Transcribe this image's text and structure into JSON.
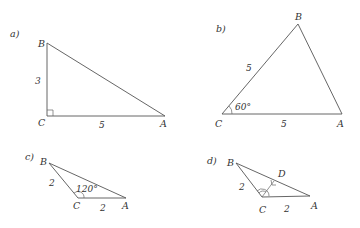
{
  "figures": [
    {
      "id": "a",
      "label": "a)",
      "vertices": {
        "A": "A",
        "B": "B",
        "C": "C"
      },
      "sides": {
        "BC": "3",
        "CA": "5"
      },
      "angle": {
        "at": "C",
        "value": "90°",
        "marker": "right-angle"
      }
    },
    {
      "id": "b",
      "label": "b)",
      "vertices": {
        "A": "A",
        "B": "B",
        "C": "C"
      },
      "sides": {
        "CB": "5",
        "CA": "5"
      },
      "angle": {
        "at": "C",
        "value": "60°"
      }
    },
    {
      "id": "c",
      "label": "c)",
      "vertices": {
        "A": "A",
        "B": "B",
        "C": "C"
      },
      "sides": {
        "BC": "2",
        "CA": "2"
      },
      "angle": {
        "at": "C",
        "value": "120°"
      }
    },
    {
      "id": "d",
      "label": "d)",
      "vertices": {
        "A": "A",
        "B": "B",
        "C": "C",
        "D": "D"
      },
      "sides": {
        "BC": "2",
        "CA": "2"
      },
      "altitude": {
        "from": "C",
        "foot": "D",
        "marker": "right-angle"
      },
      "angle": {
        "at": "C",
        "marker": "double-arc"
      }
    }
  ]
}
